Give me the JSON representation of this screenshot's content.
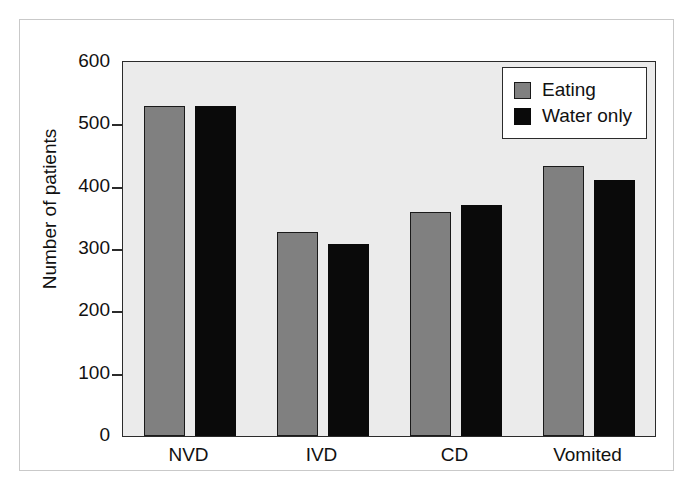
{
  "chart_data": {
    "type": "bar",
    "title": "",
    "subtitle": "",
    "xlabel": "",
    "ylabel": "Number of patients",
    "categories": [
      "NVD",
      "IVD",
      "CD",
      "Vomited"
    ],
    "series": [
      {
        "name": "Eating",
        "color": "#808080",
        "values": [
          530,
          328,
          360,
          433
        ]
      },
      {
        "name": "Water only",
        "color": "#0a0a0a",
        "values": [
          530,
          308,
          370,
          411
        ]
      }
    ],
    "ylim": [
      0,
      600
    ],
    "ytick_values": [
      0,
      100,
      200,
      300,
      400,
      500,
      600
    ],
    "ytick_labels": [
      "0",
      "100",
      "200",
      "300",
      "400",
      "500",
      "600"
    ],
    "grid": false,
    "legend_position": "top-right",
    "plot_background": "#ebebeb",
    "figure_background": "#ffffff",
    "axis_color": "#2b2b2b"
  },
  "legend": {
    "items": [
      {
        "label": "Eating",
        "swatch": "eating"
      },
      {
        "label": "Water only",
        "swatch": "water"
      }
    ]
  }
}
